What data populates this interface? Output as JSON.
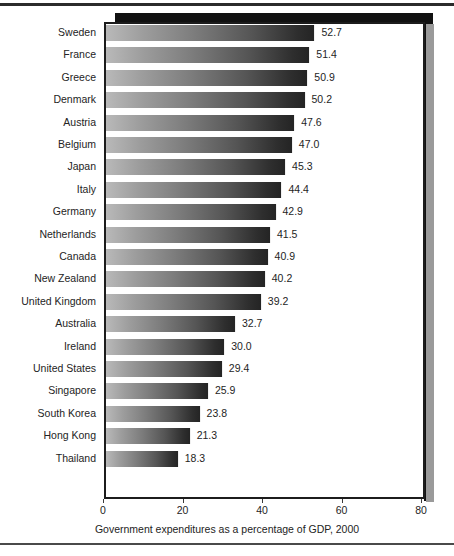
{
  "figure": {
    "name": "horizontal-bar-chart",
    "frame_color": "#111111",
    "plot_border_color": "#1c1c1c",
    "background": "#ffffff"
  },
  "chart_data": {
    "type": "bar",
    "orientation": "horizontal",
    "title": "",
    "subtitle": "",
    "xlabel": "Government expenditures as a percentage of GDP, 2000",
    "ylabel": "",
    "xlim": [
      0,
      80
    ],
    "ylim": null,
    "grid": false,
    "legend": null,
    "xticks": [
      0,
      20,
      40,
      60,
      80
    ],
    "xtick_labels": [
      "0",
      "20",
      "40",
      "60",
      "80"
    ],
    "bar_gradient": [
      "#b9b9b9",
      "#242424"
    ],
    "categories": [
      "Sweden",
      "France",
      "Greece",
      "Denmark",
      "Austria",
      "Belgium",
      "Japan",
      "Italy",
      "Germany",
      "Netherlands",
      "Canada",
      "New Zealand",
      "United Kingdom",
      "Australia",
      "Ireland",
      "United States",
      "Singapore",
      "South Korea",
      "Hong Kong",
      "Thailand"
    ],
    "values": [
      52.7,
      51.4,
      50.9,
      50.2,
      47.6,
      47.0,
      45.3,
      44.4,
      42.9,
      41.5,
      40.9,
      40.2,
      39.2,
      32.7,
      30.0,
      29.4,
      25.9,
      23.8,
      21.3,
      18.3
    ],
    "value_labels": [
      "52.7",
      "51.4",
      "50.9",
      "50.2",
      "47.6",
      "47.0",
      "45.3",
      "44.4",
      "42.9",
      "41.5",
      "40.9",
      "40.2",
      "39.2",
      "32.7",
      "30.0",
      "29.4",
      "25.9",
      "23.8",
      "21.3",
      "18.3"
    ]
  }
}
